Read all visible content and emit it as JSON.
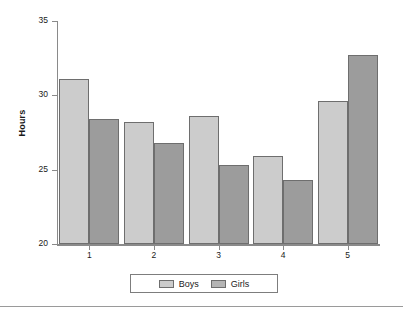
{
  "chart_data": {
    "type": "bar",
    "title": "",
    "xlabel": "",
    "ylabel": "Hours",
    "categories": [
      "1",
      "2",
      "3",
      "4",
      "5"
    ],
    "series": [
      {
        "name": "Boys",
        "color": "#cccccc",
        "values": [
          31.1,
          28.2,
          28.6,
          25.9,
          29.6
        ]
      },
      {
        "name": "Girls",
        "color": "#9c9c9c",
        "values": [
          28.4,
          26.8,
          25.3,
          24.3,
          32.7
        ]
      }
    ],
    "ylim": [
      20,
      35
    ],
    "yticks": [
      20,
      25,
      30,
      35
    ],
    "ytick_labels": [
      "20",
      "25",
      "30",
      "35"
    ],
    "grid": false,
    "legend_position": "bottom"
  },
  "legend": {
    "entries": [
      {
        "label": "Boys"
      },
      {
        "label": "Girls"
      }
    ]
  },
  "colors": {
    "boys": "#cccccc",
    "girls": "#9c9c9c",
    "axis": "#8a8a8a",
    "bar_edge": "#6e6e6e",
    "text": "#1a1a1a",
    "background": "#ffffff"
  }
}
